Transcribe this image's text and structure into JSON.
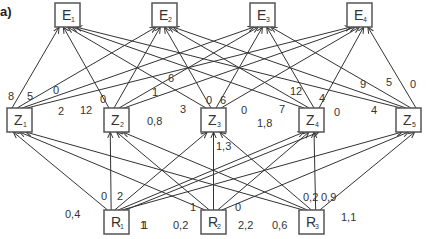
{
  "panel_label": "a)",
  "nodes": {
    "E": [
      {
        "id": "E1",
        "letter": "E",
        "sub": "1",
        "x": 55,
        "y": 3
      },
      {
        "id": "E2",
        "letter": "E",
        "sub": "2",
        "x": 152,
        "y": 3
      },
      {
        "id": "E3",
        "letter": "E",
        "sub": "3",
        "x": 250,
        "y": 3
      },
      {
        "id": "E4",
        "letter": "E",
        "sub": "4",
        "x": 347,
        "y": 3
      }
    ],
    "Z": [
      {
        "id": "Z1",
        "letter": "Z",
        "sub": "1",
        "x": 7,
        "y": 108
      },
      {
        "id": "Z2",
        "letter": "Z",
        "sub": "2",
        "x": 104,
        "y": 108
      },
      {
        "id": "Z3",
        "letter": "Z",
        "sub": "3",
        "x": 201,
        "y": 108
      },
      {
        "id": "Z4",
        "letter": "Z",
        "sub": "4",
        "x": 299,
        "y": 108
      },
      {
        "id": "Z5",
        "letter": "Z",
        "sub": "5",
        "x": 396,
        "y": 108
      }
    ],
    "R": [
      {
        "id": "R1",
        "letter": "R",
        "sub": "1",
        "x": 104,
        "y": 210
      },
      {
        "id": "R2",
        "letter": "R",
        "sub": "2",
        "x": 201,
        "y": 210
      },
      {
        "id": "R3",
        "letter": "R",
        "sub": "3",
        "x": 299,
        "y": 210
      }
    ]
  },
  "edges_Z_to_E": [
    {
      "from": "Z1",
      "to": "E1",
      "weight": "8",
      "lx": 8,
      "ly": 100
    },
    {
      "from": "Z1",
      "to": "E2",
      "weight": "5",
      "lx": 27,
      "ly": 100
    },
    {
      "from": "Z1",
      "to": "E3",
      "weight": "0",
      "lx": 53,
      "ly": 94
    },
    {
      "from": "Z1",
      "to": "E4",
      "weight": "2",
      "lx": 58,
      "ly": 115
    },
    {
      "from": "Z2",
      "to": "E1",
      "weight": "12",
      "lx": 80,
      "ly": 114
    },
    {
      "from": "Z2",
      "to": "E2",
      "weight": "0",
      "lx": 100,
      "ly": 103
    },
    {
      "from": "Z2",
      "to": "E3",
      "weight": "1",
      "lx": 152,
      "ly": 96
    },
    {
      "from": "Z2",
      "to": "E4",
      "weight": "6",
      "lx": 168,
      "ly": 82
    },
    {
      "from": "Z3",
      "to": "E1",
      "weight": "3",
      "lx": 180,
      "ly": 113
    },
    {
      "from": "Z3",
      "to": "E2",
      "weight": "0",
      "lx": 206,
      "ly": 104
    },
    {
      "from": "Z3",
      "to": "E3",
      "weight": "6",
      "lx": 220,
      "ly": 104
    },
    {
      "from": "Z3",
      "to": "E4",
      "weight": "0",
      "lx": 241,
      "ly": 114
    },
    {
      "from": "Z4",
      "to": "E1",
      "weight": "7",
      "lx": 279,
      "ly": 113
    },
    {
      "from": "Z4",
      "to": "E2",
      "weight": "12",
      "lx": 290,
      "ly": 95
    },
    {
      "from": "Z4",
      "to": "E3",
      "weight": "4",
      "lx": 319,
      "ly": 102
    },
    {
      "from": "Z4",
      "to": "E4",
      "weight": "0",
      "lx": 334,
      "ly": 116
    },
    {
      "from": "Z5",
      "to": "E1",
      "weight": "4",
      "lx": 371,
      "ly": 114
    },
    {
      "from": "Z5",
      "to": "E2",
      "weight": "9",
      "lx": 360,
      "ly": 88
    },
    {
      "from": "Z5",
      "to": "E3",
      "weight": "5",
      "lx": 386,
      "ly": 86
    },
    {
      "from": "Z5",
      "to": "E4",
      "weight": "0",
      "lx": 410,
      "ly": 88
    }
  ],
  "edges_R_to_Z": [
    {
      "from": "R1",
      "to": "Z1",
      "weight": "0,4",
      "lx": 65,
      "ly": 218
    },
    {
      "from": "R1",
      "to": "Z2",
      "weight": "0",
      "lx": 101,
      "ly": 200
    },
    {
      "from": "R1",
      "to": "Z3",
      "weight": "2",
      "lx": 117,
      "ly": 200
    },
    {
      "from": "R1",
      "to": "Z4",
      "weight": "1",
      "lx": 142,
      "ly": 229
    },
    {
      "from": "R1",
      "to": "Z5",
      "weight": "1",
      "lx": 140,
      "ly": 229
    },
    {
      "from": "R2",
      "to": "Z1",
      "weight": "0,2",
      "lx": 173,
      "ly": 229
    },
    {
      "from": "R2",
      "to": "Z2",
      "weight": "1",
      "lx": 190,
      "ly": 211
    },
    {
      "from": "R2",
      "to": "Z3",
      "weight": "1,3",
      "lx": 216,
      "ly": 150
    },
    {
      "from": "R2",
      "to": "Z4",
      "weight": "0",
      "lx": 235,
      "ly": 211
    },
    {
      "from": "R2",
      "to": "Z5",
      "weight": "2,2",
      "lx": 238,
      "ly": 229
    },
    {
      "from": "R3",
      "to": "Z1",
      "weight": "0,6",
      "lx": 272,
      "ly": 229
    },
    {
      "from": "R3",
      "to": "Z2",
      "weight": "0,8",
      "lx": 147,
      "ly": 125
    },
    {
      "from": "R3",
      "to": "Z3",
      "weight": "0,2",
      "lx": 303,
      "ly": 201
    },
    {
      "from": "R3",
      "to": "Z4",
      "weight": "0,9",
      "lx": 321,
      "ly": 201
    },
    {
      "from": "R3",
      "to": "Z5",
      "weight": "1,1",
      "lx": 341,
      "ly": 221
    },
    {
      "from": "R1",
      "to": "Z4",
      "weight": "1,8",
      "lx": 257,
      "ly": 127
    }
  ]
}
